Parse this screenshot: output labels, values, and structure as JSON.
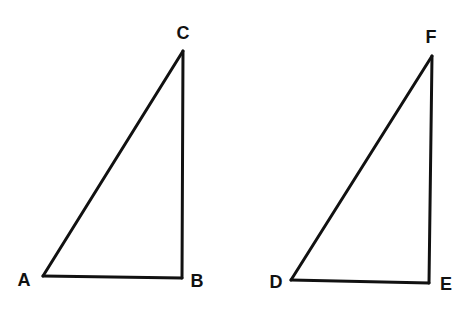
{
  "diagram": {
    "type": "two-right-triangles",
    "triangles": [
      {
        "name": "ABC",
        "vertices": {
          "A": "A",
          "B": "B",
          "C": "C"
        },
        "right_angle_at": "B"
      },
      {
        "name": "DEF",
        "vertices": {
          "D": "D",
          "E": "E",
          "F": "F"
        },
        "right_angle_at": "E"
      }
    ],
    "labels": {
      "A": "A",
      "B": "B",
      "C": "C",
      "D": "D",
      "E": "E",
      "F": "F"
    },
    "colors": {
      "stroke": "#111111",
      "background": "#ffffff"
    }
  }
}
